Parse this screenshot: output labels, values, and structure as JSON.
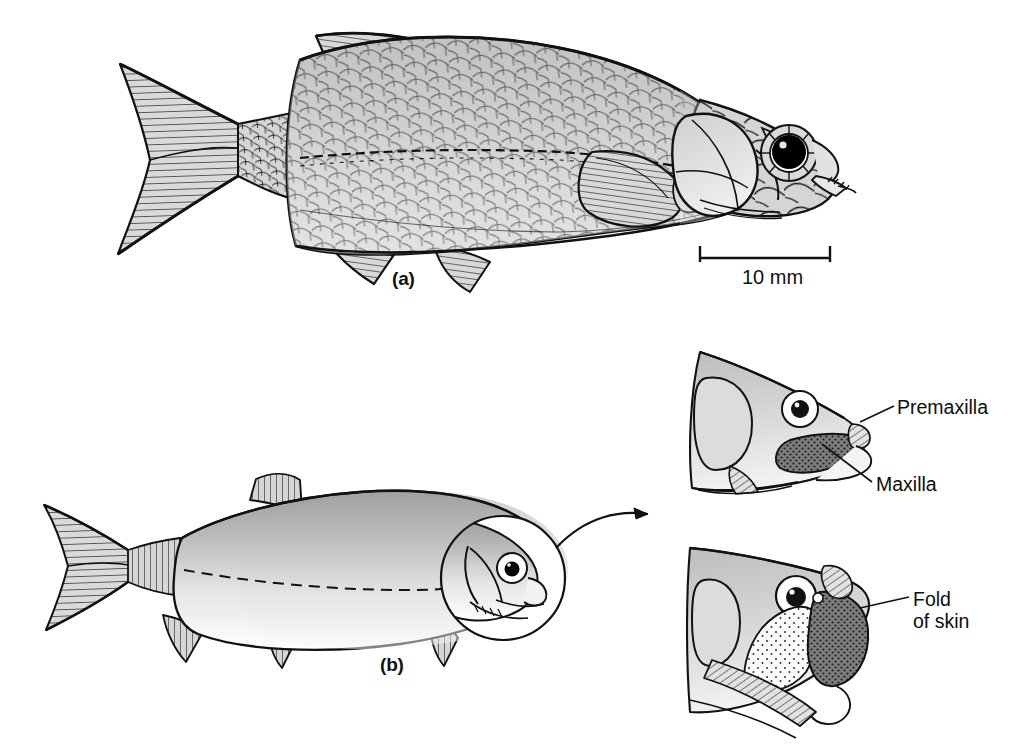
{
  "figure": {
    "background_color": "#ffffff",
    "ink_color": "#111111",
    "panels": [
      {
        "id": "a",
        "label": "(a)",
        "subject": "scaled deep-bodied fish, whole lateral view",
        "detail_level": "high-detail scale-by-scale line drawing"
      },
      {
        "id": "b",
        "label": "(b)",
        "subject": "smooth-shaded fusiform fish, whole lateral view with magnifier on head",
        "detail_level": "smooth tonal rendering, dashed lateral line"
      }
    ],
    "scale_bar": {
      "label": "10 mm",
      "value": 10,
      "unit": "mm",
      "x_start": 700,
      "x_end": 830,
      "y": 258
    },
    "annotations": [
      {
        "id": "premaxilla",
        "text": "Premaxilla",
        "lines": [
          "Premaxilla"
        ],
        "leader_from": [
          894,
          406
        ],
        "leader_to": [
          860,
          422
        ],
        "panel": "detail-upper"
      },
      {
        "id": "maxilla",
        "text": "Maxilla",
        "lines": [
          "Maxilla"
        ],
        "leader_from": [
          872,
          482
        ],
        "leader_to": [
          822,
          444
        ],
        "panel": "detail-upper"
      },
      {
        "id": "fold-of-skin",
        "text": "Fold of skin",
        "lines": [
          "Fold",
          "of skin"
        ],
        "leader_from": [
          909,
          597
        ],
        "leader_to": [
          860,
          608
        ],
        "panel": "detail-lower"
      }
    ],
    "detail_views": [
      {
        "id": "detail-upper",
        "caption_parts": [
          "Premaxilla",
          "Maxilla"
        ],
        "state": "mouth closed, maxilla stippled dark"
      },
      {
        "id": "detail-lower",
        "caption_parts": [
          "Fold of skin"
        ],
        "state": "mouth protruded, fold of skin stippled light"
      }
    ],
    "colors": {
      "ink": "#111111",
      "scale_fill_light": "#d8d8d8",
      "scale_fill_mid": "#bdbdbd",
      "scale_fill_dark": "#9a9a9a",
      "body_highlight": "#fdfdfd",
      "eye_pupil": "#000000",
      "maxilla_dark": "#6e6e6e",
      "fold_stipple": "#f2f2f2"
    }
  }
}
